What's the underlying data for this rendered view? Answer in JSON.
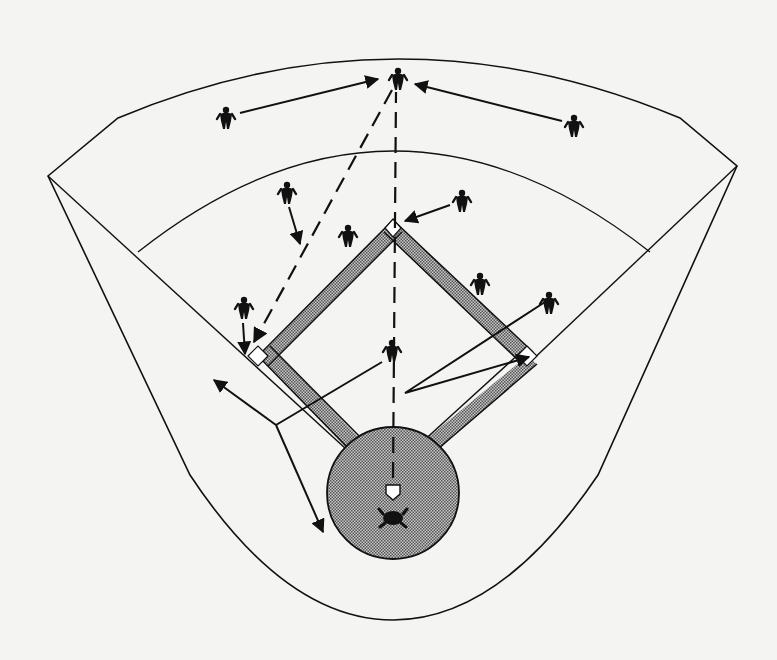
{
  "diagram": {
    "colors": {
      "background": "#f4f4f2",
      "line": "#111111",
      "dirt_fill": "#8a8a8a",
      "base": "#ffffff"
    },
    "fielders": [
      {
        "id": "center-fielder",
        "x": 398,
        "y": 78
      },
      {
        "id": "left-fielder",
        "x": 226,
        "y": 117
      },
      {
        "id": "right-fielder",
        "x": 574,
        "y": 125
      },
      {
        "id": "shortstop-deep",
        "x": 287,
        "y": 192
      },
      {
        "id": "second-baseman",
        "x": 462,
        "y": 200
      },
      {
        "id": "shortstop",
        "x": 348,
        "y": 235
      },
      {
        "id": "first-baseman-deep",
        "x": 480,
        "y": 283
      },
      {
        "id": "right-side-fielder",
        "x": 549,
        "y": 302
      },
      {
        "id": "third-baseman",
        "x": 244,
        "y": 307
      },
      {
        "id": "pitcher",
        "x": 392,
        "y": 350
      },
      {
        "id": "catcher",
        "x": 393,
        "y": 518
      }
    ],
    "bases": {
      "home": {
        "x": 393,
        "y": 492
      },
      "first": {
        "x": 527,
        "y": 356
      },
      "second": {
        "x": 393,
        "y": 226
      },
      "third": {
        "x": 258,
        "y": 356
      }
    }
  }
}
